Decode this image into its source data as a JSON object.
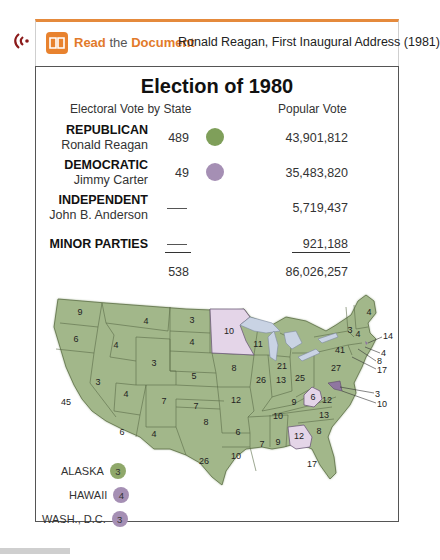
{
  "header": {
    "audio_icon": "audio-speaker-icon",
    "book_icon": "open-book-icon",
    "read_word": "Read",
    "the_word": "the",
    "document_word": "Document",
    "document_title": "Ronald Reagan, First Inaugural Address (1981)",
    "accent_color": "#e58a3c"
  },
  "figure": {
    "title": "Election of 1980",
    "col_electoral": "Electoral Vote by State",
    "col_popular": "Popular Vote",
    "rows": [
      {
        "party": "REPUBLICAN",
        "candidate": "Ronald Reagan",
        "electoral": "489",
        "popular": "43,901,812",
        "color": "#7f9f5a"
      },
      {
        "party": "DEMOCRATIC",
        "candidate": "Jimmy Carter",
        "electoral": "49",
        "popular": "35,483,820",
        "color": "#a58fb4"
      },
      {
        "party": "INDEPENDENT",
        "candidate": "John B. Anderson",
        "electoral": "—",
        "popular": "5,719,437",
        "color": ""
      },
      {
        "party": "MINOR PARTIES",
        "candidate": "",
        "electoral": "—",
        "popular": "921,188",
        "color": ""
      }
    ],
    "total_electoral": "538",
    "total_popular": "86,026,257"
  },
  "map": {
    "republican_color": "#9fb584",
    "democratic_color": "#e2d3e6",
    "state_labels": [
      {
        "state": "WA",
        "ev": "9",
        "party": "R"
      },
      {
        "state": "OR",
        "ev": "6",
        "party": "R"
      },
      {
        "state": "CA",
        "ev": "45",
        "party": "R"
      },
      {
        "state": "ID",
        "ev": "4",
        "party": "R"
      },
      {
        "state": "NV",
        "ev": "3",
        "party": "R"
      },
      {
        "state": "MT",
        "ev": "4",
        "party": "R"
      },
      {
        "state": "WY",
        "ev": "3",
        "party": "R"
      },
      {
        "state": "UT",
        "ev": "4",
        "party": "R"
      },
      {
        "state": "AZ",
        "ev": "6",
        "party": "R"
      },
      {
        "state": "CO",
        "ev": "7",
        "party": "R"
      },
      {
        "state": "NM",
        "ev": "4",
        "party": "R"
      },
      {
        "state": "ND",
        "ev": "3",
        "party": "R"
      },
      {
        "state": "SD",
        "ev": "4",
        "party": "R"
      },
      {
        "state": "NE",
        "ev": "5",
        "party": "R"
      },
      {
        "state": "KS",
        "ev": "7",
        "party": "R"
      },
      {
        "state": "OK",
        "ev": "8",
        "party": "R"
      },
      {
        "state": "TX",
        "ev": "26",
        "party": "R"
      },
      {
        "state": "MN",
        "ev": "10",
        "party": "D"
      },
      {
        "state": "IA",
        "ev": "8",
        "party": "R"
      },
      {
        "state": "MO",
        "ev": "12",
        "party": "R"
      },
      {
        "state": "AR",
        "ev": "6",
        "party": "R"
      },
      {
        "state": "LA",
        "ev": "10",
        "party": "R"
      },
      {
        "state": "WI",
        "ev": "11",
        "party": "R"
      },
      {
        "state": "IL",
        "ev": "26",
        "party": "R"
      },
      {
        "state": "MI",
        "ev": "21",
        "party": "R"
      },
      {
        "state": "IN",
        "ev": "13",
        "party": "R"
      },
      {
        "state": "OH",
        "ev": "25",
        "party": "R"
      },
      {
        "state": "KY",
        "ev": "9",
        "party": "R"
      },
      {
        "state": "TN",
        "ev": "10",
        "party": "R"
      },
      {
        "state": "MS",
        "ev": "7",
        "party": "R"
      },
      {
        "state": "AL",
        "ev": "9",
        "party": "R"
      },
      {
        "state": "GA",
        "ev": "12",
        "party": "D"
      },
      {
        "state": "FL",
        "ev": "17",
        "party": "R"
      },
      {
        "state": "SC",
        "ev": "8",
        "party": "R"
      },
      {
        "state": "NC",
        "ev": "13",
        "party": "R"
      },
      {
        "state": "VA",
        "ev": "12",
        "party": "R"
      },
      {
        "state": "WV",
        "ev": "6",
        "party": "D"
      },
      {
        "state": "PA",
        "ev": "27",
        "party": "R"
      },
      {
        "state": "NY",
        "ev": "41",
        "party": "R"
      },
      {
        "state": "VT",
        "ev": "3",
        "party": "R"
      },
      {
        "state": "NH",
        "ev": "4",
        "party": "R"
      },
      {
        "state": "ME",
        "ev": "4",
        "party": "R"
      },
      {
        "state": "MA",
        "ev": "14",
        "party": "R"
      },
      {
        "state": "RI",
        "ev": "4",
        "party": "D"
      },
      {
        "state": "CT",
        "ev": "8",
        "party": "R"
      },
      {
        "state": "NJ",
        "ev": "17",
        "party": "R"
      },
      {
        "state": "DE",
        "ev": "3",
        "party": "R"
      },
      {
        "state": "MD",
        "ev": "10",
        "party": "D"
      }
    ],
    "insets": [
      {
        "label": "ALASKA",
        "ev": "3",
        "color": "#8fa86a"
      },
      {
        "label": "HAWAII",
        "ev": "4",
        "color": "#a58fb4"
      },
      {
        "label": "WASH., D.C.",
        "ev": "3",
        "color": "#a58fb4"
      }
    ]
  }
}
